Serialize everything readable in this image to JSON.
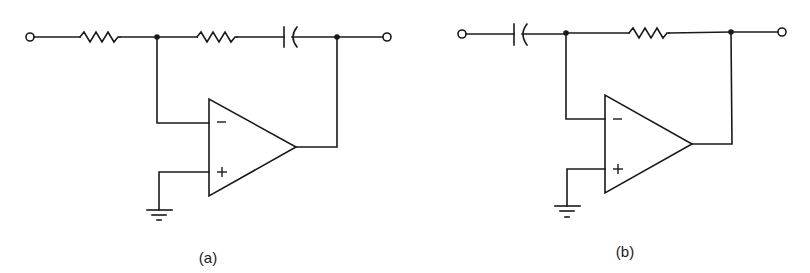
{
  "figure": {
    "circuits": [
      {
        "id": "a",
        "label": "(a)",
        "description": "Inverting op-amp: series input resistor, feedback path of resistor in series with capacitor",
        "components": [
          {
            "type": "terminal",
            "role": "input"
          },
          {
            "type": "resistor",
            "role": "input-resistor"
          },
          {
            "type": "node",
            "role": "inverting-input-junction"
          },
          {
            "type": "resistor",
            "role": "feedback-resistor"
          },
          {
            "type": "capacitor",
            "role": "feedback-capacitor"
          },
          {
            "type": "node",
            "role": "output-junction"
          },
          {
            "type": "terminal",
            "role": "output"
          },
          {
            "type": "op-amp",
            "inputs": {
              "inverting": "−",
              "non_inverting": "+"
            }
          },
          {
            "type": "ground",
            "role": "non-inverting-ground"
          }
        ]
      },
      {
        "id": "b",
        "label": "(b)",
        "description": "Inverting op-amp: series input capacitor, feedback resistor (differentiator)",
        "components": [
          {
            "type": "terminal",
            "role": "input"
          },
          {
            "type": "capacitor",
            "role": "input-capacitor"
          },
          {
            "type": "node",
            "role": "inverting-input-junction"
          },
          {
            "type": "resistor",
            "role": "feedback-resistor"
          },
          {
            "type": "node",
            "role": "output-junction"
          },
          {
            "type": "terminal",
            "role": "output"
          },
          {
            "type": "op-amp",
            "inputs": {
              "inverting": "−",
              "non_inverting": "+"
            }
          },
          {
            "type": "ground",
            "role": "non-inverting-ground"
          }
        ]
      }
    ]
  }
}
